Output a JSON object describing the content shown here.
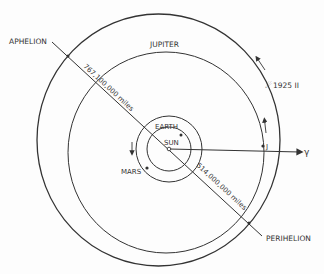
{
  "labels": {
    "aphelion": "APHELION",
    "perihelion": "PERIHELION",
    "jupiter": "JUPITER",
    "earth": "EARTH",
    "sun": "SUN",
    "mars": "MARS",
    "jupiter_position": "J",
    "comet": "1925 II",
    "direction": "γ",
    "aphelion_distance": "767,100,000 miles",
    "perihelion_distance": "514,000,000 miles"
  },
  "colors": {
    "line": "#333333",
    "background": "#fdfdfd"
  }
}
